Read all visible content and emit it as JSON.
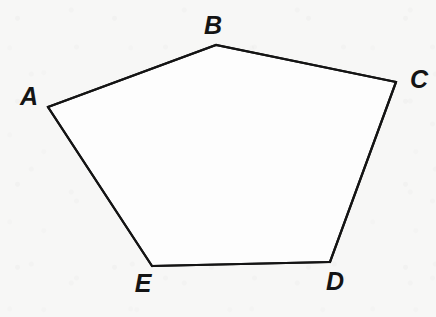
{
  "figure": {
    "kind": "geometry-diagram",
    "shape_name": "pentagon",
    "canvas": {
      "width": 436,
      "height": 317
    },
    "style": {
      "background_color": "#f7f7f6",
      "paper_tint": "#f7f7f6",
      "stroke_color": "#141414",
      "stroke_width": 2.2,
      "fill_color": "#fdfdfd",
      "label_color": "#141414",
      "label_font_size": 25
    },
    "vertices": [
      {
        "id": "A",
        "label": "A",
        "x": 48,
        "y": 107,
        "label_x": 29,
        "label_y": 96
      },
      {
        "id": "B",
        "label": "B",
        "x": 216,
        "y": 45,
        "label_x": 213,
        "label_y": 25
      },
      {
        "id": "C",
        "label": "C",
        "x": 396,
        "y": 82,
        "label_x": 419,
        "label_y": 79
      },
      {
        "id": "D",
        "label": "D",
        "x": 330,
        "y": 262,
        "label_x": 335,
        "label_y": 281
      },
      {
        "id": "E",
        "label": "E",
        "x": 152,
        "y": 266,
        "label_x": 143,
        "label_y": 283
      }
    ],
    "edges": [
      {
        "id": "AB",
        "from": "A",
        "to": "B"
      },
      {
        "id": "BC",
        "from": "B",
        "to": "C"
      },
      {
        "id": "CD",
        "from": "C",
        "to": "D"
      },
      {
        "id": "DE",
        "from": "D",
        "to": "E"
      },
      {
        "id": "EA",
        "from": "E",
        "to": "A"
      }
    ],
    "polygon_points": "48,107 216,45 396,82 330,262 152,266"
  }
}
